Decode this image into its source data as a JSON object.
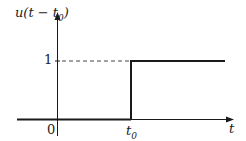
{
  "diagram": {
    "y_label": "u(t − t",
    "y_label_sub": "0",
    "y_label_close": ")",
    "x_label": "t",
    "tick_one": "1",
    "tick_zero": "0",
    "tick_t0": "t",
    "tick_t0_sub": "0",
    "colors": {
      "line": "#1a1a1a",
      "dash": "#444444"
    }
  }
}
